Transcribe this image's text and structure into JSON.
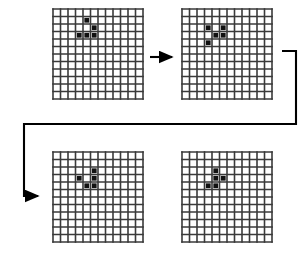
{
  "figure": {
    "title": "",
    "background_color": "#ffffff",
    "grid_line_color": "#3a3a3a",
    "cell_fill_color": "#111111",
    "arrow_color": "#000000",
    "panel_count": 4
  },
  "grid": {
    "columns": 12,
    "rows": 12,
    "size_px": 90,
    "cell_px": 7.5,
    "line_width_px": 1.6
  },
  "panels": [
    {
      "id": "panel-1",
      "label": "generation-1",
      "position": {
        "x": 53,
        "y": 9
      },
      "live_cells": [
        {
          "col": 4,
          "row": 1
        },
        {
          "col": 5,
          "row": 2
        },
        {
          "col": 3,
          "row": 3
        },
        {
          "col": 4,
          "row": 3
        },
        {
          "col": 5,
          "row": 3
        }
      ]
    },
    {
      "id": "panel-2",
      "label": "generation-2",
      "position": {
        "x": 182,
        "y": 9
      },
      "live_cells": [
        {
          "col": 3,
          "row": 2
        },
        {
          "col": 5,
          "row": 2
        },
        {
          "col": 4,
          "row": 3
        },
        {
          "col": 5,
          "row": 3
        },
        {
          "col": 3,
          "row": 4
        }
      ]
    },
    {
      "id": "panel-3",
      "label": "generation-3",
      "position": {
        "x": 53,
        "y": 152
      },
      "live_cells": [
        {
          "col": 5,
          "row": 2
        },
        {
          "col": 3,
          "row": 3
        },
        {
          "col": 5,
          "row": 3
        },
        {
          "col": 4,
          "row": 4
        },
        {
          "col": 5,
          "row": 4
        }
      ]
    },
    {
      "id": "panel-4",
      "label": "generation-4",
      "position": {
        "x": 182,
        "y": 152
      },
      "live_cells": [
        {
          "col": 4,
          "row": 2
        },
        {
          "col": 4,
          "row": 3
        },
        {
          "col": 5,
          "row": 3
        },
        {
          "col": 3,
          "row": 4
        },
        {
          "col": 4,
          "row": 4
        }
      ]
    }
  ],
  "connectors": [
    {
      "id": "arrow-1-to-2",
      "type": "straight-arrow",
      "direction": "right",
      "from_panel": "panel-1",
      "to_panel": "panel-2",
      "path": "M 150 57 L 172 57"
    },
    {
      "id": "arrow-2-to-3",
      "type": "elbow-arrow",
      "direction": "wrap-left-down",
      "from_panel": "panel-2",
      "to_panel": "panel-3",
      "path": "M 282 51 L 296 51 L 296 124 L 24 124 L 24 196 L 38 196"
    }
  ]
}
